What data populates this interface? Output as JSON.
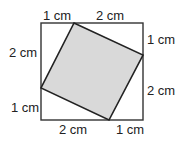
{
  "diagram": {
    "outer_square": {
      "side_cm": 3,
      "stroke": "#333333"
    },
    "inner_square": {
      "fill": "#d9d9d9",
      "stroke": "#222222"
    },
    "labels": {
      "top_left": "1 cm",
      "top_right": "2 cm",
      "right_top": "1 cm",
      "right_bottom": "2 cm",
      "bottom_right": "1 cm",
      "bottom_left": "2 cm",
      "left_bottom": "1 cm",
      "left_top": "2 cm"
    }
  }
}
